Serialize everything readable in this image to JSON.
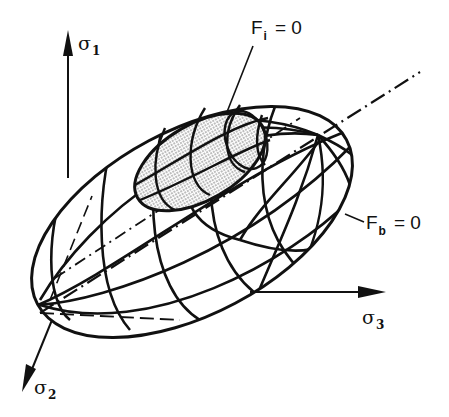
{
  "figure": {
    "colors": {
      "ink": "#111111",
      "background": "#ffffff",
      "stipple": "#9a9a9a"
    }
  },
  "axes": {
    "sigma1": {
      "symbol": "σ",
      "subscript": "1"
    },
    "sigma2": {
      "symbol": "σ",
      "subscript": "2"
    },
    "sigma3": {
      "symbol": "σ",
      "subscript": "3"
    }
  },
  "surfaces": {
    "inner": {
      "name": "F",
      "subscript": "i",
      "equation": "= 0",
      "style": "stippled"
    },
    "outer": {
      "name": "F",
      "subscript": "b",
      "equation": "= 0",
      "style": "wireframe"
    }
  },
  "annotations": {
    "hydrostatic_axis": "dash-dot line"
  }
}
